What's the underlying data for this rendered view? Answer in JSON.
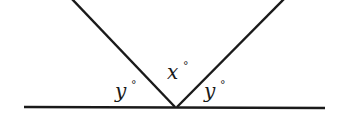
{
  "diagram": {
    "type": "angle-figure",
    "labels": {
      "left_angle": {
        "var": "y",
        "unit": "°"
      },
      "middle_angle": {
        "var": "x",
        "unit": "°"
      },
      "right_angle": {
        "var": "y",
        "unit": "°"
      }
    },
    "colors": {
      "stroke": "#1a1a1a",
      "background": "#ffffff"
    }
  }
}
